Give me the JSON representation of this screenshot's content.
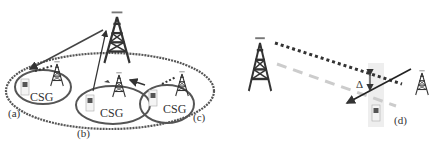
{
  "diagram": {
    "left_panel": {
      "labels": {
        "a": "(a)",
        "b": "(b)",
        "c": "(c)"
      },
      "csg_labels": [
        "CSG",
        "CSG",
        "CSG"
      ]
    },
    "right_panel": {
      "labels": {
        "d": "(d)",
        "delta": "Δ"
      }
    },
    "colors": {
      "ellipse": "#555555",
      "tower": "#333333",
      "arrow": "#333333",
      "dashed_gray": "#cccccc",
      "highlight": "#eeeeee"
    }
  }
}
